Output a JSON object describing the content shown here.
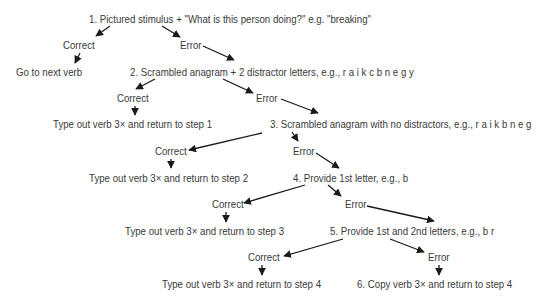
{
  "diagram": {
    "type": "flowchart",
    "nodes": {
      "step1": "1.  Pictured stimulus + \"What is this person doing?\" e.g. \"breaking\"",
      "correct1": "Correct",
      "error1": "Error",
      "next_verb": "Go to next verb",
      "step2": "2.  Scrambled anagram + 2 distractor letters, e.g., r a i k c b n e g y",
      "correct2": "Correct",
      "error2": "Error",
      "return1": "Type out verb 3× and return to step 1",
      "step3": "3.  Scrambled anagram with no distractors, e.g., r a i k b n e g",
      "correct3": "Correct",
      "error3": "Error",
      "return2": "Type out verb 3× and return to step 2",
      "step4": "4.  Provide 1st letter, e.g., b",
      "correct4": "Correct",
      "error4": "Error",
      "return3": "Type out verb 3× and return to step 3",
      "step5": "5.  Provide 1st and 2nd letters, e.g., b r",
      "correct5": "Correct",
      "error5": "Error",
      "return4": "Type out verb 3× and return to step 4",
      "step6": "6.  Copy verb 3× and return to step 4"
    },
    "edges": [
      [
        "step1",
        "correct1"
      ],
      [
        "step1",
        "error1"
      ],
      [
        "correct1",
        "next_verb"
      ],
      [
        "error1",
        "step2"
      ],
      [
        "step2",
        "correct2"
      ],
      [
        "step2",
        "error2"
      ],
      [
        "correct2",
        "return1"
      ],
      [
        "error2",
        "step3"
      ],
      [
        "step3",
        "correct3"
      ],
      [
        "step3",
        "error3"
      ],
      [
        "correct3",
        "return2"
      ],
      [
        "error3",
        "step4"
      ],
      [
        "step4",
        "correct4"
      ],
      [
        "step4",
        "error4"
      ],
      [
        "correct4",
        "return3"
      ],
      [
        "error4",
        "step5"
      ],
      [
        "step5",
        "correct5"
      ],
      [
        "step5",
        "error5"
      ],
      [
        "correct5",
        "return4"
      ],
      [
        "error5",
        "step6"
      ]
    ],
    "colors": {
      "text": "#3a3a3a",
      "arrow": "#1a1a1a",
      "background": "#ffffff"
    }
  }
}
